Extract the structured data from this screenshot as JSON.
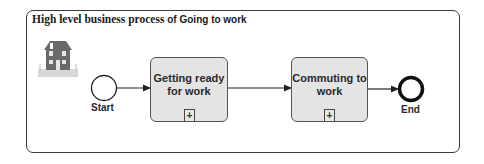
{
  "diagram": {
    "title_serif": "High level business process ",
    "title_sans": "of Going to work",
    "icon": "house-icon",
    "start_event": {
      "label": "Start"
    },
    "tasks": [
      {
        "label": "Getting ready for work",
        "marker": "+"
      },
      {
        "label": "Commuting to work",
        "marker": "+"
      }
    ],
    "end_event": {
      "label": "End"
    },
    "colors": {
      "task_fill": "#e4e4e4",
      "stroke": "#333333",
      "house": "#6a6a6a"
    }
  }
}
